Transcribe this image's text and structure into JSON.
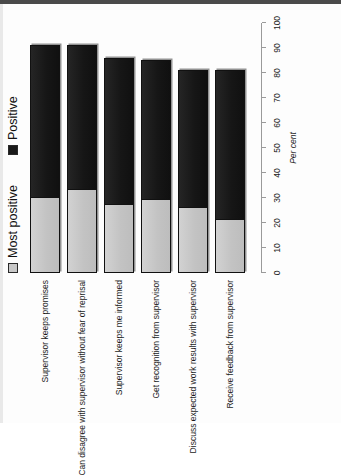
{
  "chart_data": {
    "type": "bar",
    "orientation": "horizontal",
    "stacked": true,
    "title": "",
    "xlabel": "Per cent",
    "ylabel": "",
    "xlim": [
      0,
      100
    ],
    "xticks": [
      0,
      10,
      20,
      30,
      40,
      50,
      60,
      70,
      80,
      90,
      100
    ],
    "grid": false,
    "legend_position": "top",
    "categories": [
      "Supervisor keeps promises",
      "Can disagree with supervisor without fear of reprisal",
      "Supervisor keeps me informed",
      "Get recognition from supervisor",
      "Discuss expected work results with supervisor",
      "Receive feedback from supervisor"
    ],
    "series": [
      {
        "name": "Most positive",
        "color": "#c6c6c6",
        "values": [
          30,
          33,
          27,
          29,
          26,
          21
        ]
      },
      {
        "name": "Positive",
        "color": "#161616",
        "values": [
          61,
          58,
          59,
          56,
          55,
          60
        ]
      }
    ],
    "totals": [
      91,
      91,
      86,
      85,
      81,
      81
    ]
  },
  "legend": {
    "items": [
      {
        "label": "Most positive",
        "swatch": "light-square-swatch"
      },
      {
        "label": "Positive",
        "swatch": "dark-square-swatch"
      }
    ]
  },
  "axis": {
    "title": "Per cent",
    "ticks": [
      "0",
      "10",
      "20",
      "30",
      "40",
      "50",
      "60",
      "70",
      "80",
      "90",
      "100"
    ]
  }
}
